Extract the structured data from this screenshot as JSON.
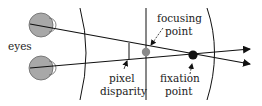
{
  "diagram": {
    "labels": {
      "eyes": "eyes",
      "focusing_point_line1": "focusing",
      "focusing_point_line2": "point",
      "pixel_disparity_line1": "pixel",
      "pixel_disparity_line2": "disparity",
      "fixation_point_line1": "fixation",
      "fixation_point_line2": "point"
    },
    "colors": {
      "line": "#111111",
      "eye_fill": "#a8a8a8",
      "focus_dot": "#8a8a8a",
      "fixation_dot": "#111111",
      "background": "#ffffff"
    }
  }
}
